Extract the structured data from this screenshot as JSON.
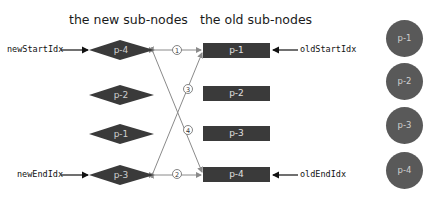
{
  "headings": {
    "new_nodes": "the new sub-nodes",
    "old_nodes": "the old sub-nodes"
  },
  "pointers": {
    "new_start": "newStartIdx",
    "new_end": "newEndIdx",
    "old_start": "oldStartIdx",
    "old_end": "oldEndIdx"
  },
  "new_nodes": [
    {
      "label": "p-4"
    },
    {
      "label": "p-2"
    },
    {
      "label": "p-1"
    },
    {
      "label": "p-3"
    }
  ],
  "old_nodes": [
    {
      "label": "p-1"
    },
    {
      "label": "p-2"
    },
    {
      "label": "p-3"
    },
    {
      "label": "p-4"
    }
  ],
  "real_dom_nodes": [
    {
      "label": "p-1"
    },
    {
      "label": "p-2"
    },
    {
      "label": "p-3"
    },
    {
      "label": "p-4"
    }
  ],
  "comparisons": [
    {
      "step": "①",
      "from": "new p-4 (start)",
      "to": "old p-1 (start)"
    },
    {
      "step": "②",
      "from": "new p-3 (end)",
      "to": "old p-4 (end)"
    },
    {
      "step": "③",
      "from": "new p-3 (end)",
      "to": "old p-1 (start)"
    },
    {
      "step": "④",
      "from": "new p-4 (start)",
      "to": "old p-4 (end)"
    }
  ],
  "colors": {
    "node_dark": "#3a3a3a",
    "circle_fill": "#595959",
    "line_gray": "#8a8a8a",
    "text": "#111111"
  }
}
